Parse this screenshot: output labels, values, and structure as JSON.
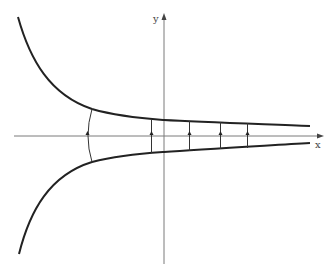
{
  "diagram": {
    "axes": {
      "x_label": "x",
      "y_label": "y",
      "color": "#7a7a7a"
    },
    "curves": {
      "upper": {
        "name": "upper-hyperbola",
        "color": "#222222"
      },
      "lower": {
        "name": "lower-hyperbola",
        "color": "#222222"
      }
    },
    "connectors": {
      "count": 5,
      "arrow_direction": "up",
      "color": "#333333"
    }
  }
}
